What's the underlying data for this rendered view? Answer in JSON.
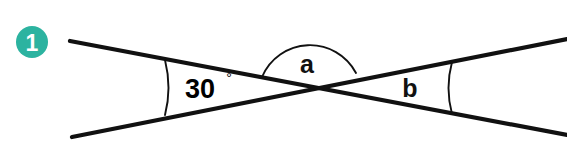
{
  "figure": {
    "background_color": "#ffffff",
    "line_color": "#111111",
    "badge": {
      "number": "1",
      "color": "#2cb3a0",
      "text_color": "#ffffff",
      "center_x": 32,
      "center_y": 42,
      "radius": 16
    },
    "intersection": {
      "x": 311,
      "y": 88
    },
    "lines": [
      {
        "name": "line-upper-left-to-lower-right",
        "x1": 70,
        "y1": 41,
        "x2": 567,
        "y2": 135
      },
      {
        "name": "line-lower-left-to-upper-right",
        "x1": 72,
        "y1": 137,
        "x2": 567,
        "y2": 39
      }
    ],
    "angles": [
      {
        "id": "angle-left",
        "label": "30",
        "degree_symbol": "°",
        "value": "30°",
        "label_x": 205,
        "label_y": 88,
        "arc_path": "M 165 60 Q 172 88 165 115"
      },
      {
        "id": "angle-top",
        "label": "a",
        "value": "a",
        "label_x": 307,
        "label_y": 64,
        "arc_path": "M 262 77 A 52 52 0 0 1 356 73"
      },
      {
        "id": "angle-right",
        "label": "b",
        "value": "b",
        "label_x": 410,
        "label_y": 88,
        "arc_path": "M 452 62 Q 445 88 452 114"
      }
    ]
  }
}
